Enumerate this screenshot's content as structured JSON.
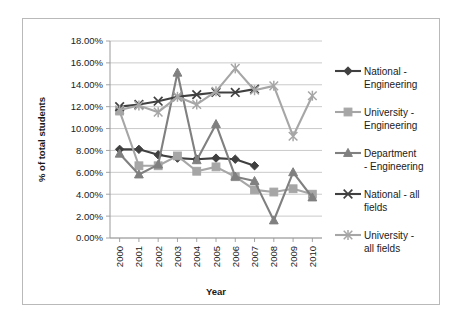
{
  "chart_data": {
    "type": "line",
    "title": "",
    "xlabel": "Year",
    "ylabel": "% of total students",
    "categories": [
      "2000",
      "2001",
      "2002",
      "2003",
      "2004",
      "2005",
      "2006",
      "2007",
      "2008",
      "2009",
      "2010"
    ],
    "ylim": [
      0,
      18
    ],
    "ytick_labels": [
      "0.00%",
      "2.00%",
      "4.00%",
      "6.00%",
      "8.00%",
      "10.00%",
      "12.00%",
      "14.00%",
      "16.00%",
      "18.00%"
    ],
    "ytick_values": [
      0,
      2,
      4,
      6,
      8,
      10,
      12,
      14,
      16,
      18
    ],
    "grid": true,
    "legend_position": "right",
    "series": [
      {
        "name": "National - Engineering",
        "marker": "diamond",
        "color": "#404040",
        "values": [
          8.1,
          8.1,
          7.6,
          7.3,
          7.2,
          7.3,
          7.2,
          6.6,
          null,
          null,
          null
        ]
      },
      {
        "name": "University - Engineering",
        "marker": "square",
        "color": "#a6a6a6",
        "values": [
          11.6,
          6.6,
          6.6,
          7.5,
          6.1,
          6.5,
          5.6,
          4.4,
          4.2,
          4.5,
          4.0
        ]
      },
      {
        "name": "Department - Engineering",
        "marker": "triangle",
        "color": "#808080",
        "values": [
          7.7,
          5.8,
          6.7,
          15.1,
          7.1,
          10.4,
          5.6,
          5.2,
          1.6,
          6.0,
          3.7
        ]
      },
      {
        "name": "National - all fields",
        "marker": "x",
        "color": "#404040",
        "values": [
          12.0,
          12.2,
          12.5,
          12.9,
          13.1,
          13.3,
          13.3,
          13.6,
          null,
          null,
          null
        ]
      },
      {
        "name": "University - all fields",
        "marker": "star",
        "color": "#a6a6a6",
        "values": [
          11.7,
          12.1,
          11.5,
          12.9,
          12.2,
          13.4,
          15.5,
          13.5,
          13.9,
          9.3,
          13.0
        ]
      }
    ]
  }
}
